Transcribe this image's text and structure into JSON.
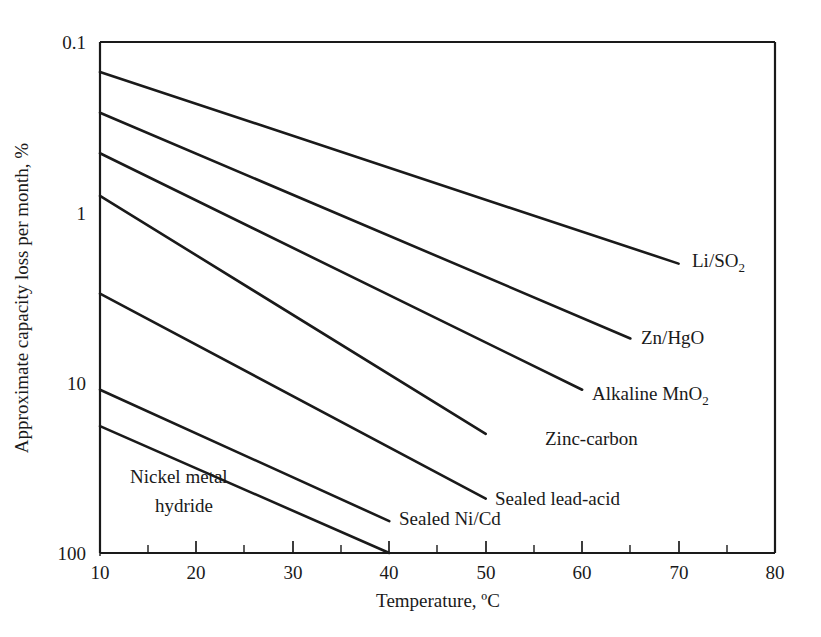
{
  "chart_data": {
    "type": "line",
    "title": "",
    "xlabel": "Temperature, ºC",
    "ylabel": "Approximate capacity loss per month, %",
    "xlim": [
      10,
      80
    ],
    "ylim": [
      0.1,
      100
    ],
    "yscale": "log",
    "y_inverted": true,
    "grid": false,
    "legend_position": "inline-right-of-each-line",
    "x_ticks": [
      10,
      20,
      30,
      40,
      50,
      60,
      70,
      80
    ],
    "x_tick_labels": [
      "10",
      "20",
      "30",
      "40",
      "50",
      "60",
      "70",
      "80"
    ],
    "x_minor_ticks": [
      15,
      25,
      35,
      45,
      55,
      65,
      75
    ],
    "y_ticks": [
      0.1,
      1,
      10,
      100
    ],
    "y_tick_labels": [
      "0.1",
      "1",
      "10",
      "100"
    ],
    "series": [
      {
        "name": "Li/SO2",
        "label": "Li/SO",
        "label_sub": "2",
        "points": [
          [
            10,
            0.15
          ],
          [
            70,
            2.0
          ]
        ]
      },
      {
        "name": "Zn/HgO",
        "label": "Zn/HgO",
        "label_sub": "",
        "points": [
          [
            10,
            0.26
          ],
          [
            65,
            5.5
          ]
        ]
      },
      {
        "name": "Alkaline MnO2",
        "label": "Alkaline MnO",
        "label_sub": "2",
        "points": [
          [
            10,
            0.45
          ],
          [
            60,
            11.0
          ]
        ]
      },
      {
        "name": "Zinc-carbon",
        "label": "Zinc-carbon",
        "label_sub": "",
        "points": [
          [
            10,
            0.8
          ],
          [
            50,
            20.0
          ]
        ]
      },
      {
        "name": "Sealed lead-acid",
        "label": "Sealed lead-acid",
        "label_sub": "",
        "points": [
          [
            10,
            3.0
          ],
          [
            50,
            48.0
          ]
        ]
      },
      {
        "name": "Sealed Ni/Cd",
        "label": "Sealed Ni/Cd",
        "label_sub": "",
        "points": [
          [
            10,
            11.0
          ],
          [
            40,
            65.0
          ]
        ]
      },
      {
        "name": "Nickel metal hydride",
        "label": "Nickel metal",
        "label_line2": "hydride",
        "label_sub": "",
        "points": [
          [
            10,
            18.0
          ],
          [
            40,
            100.0
          ]
        ]
      }
    ]
  },
  "labels": {
    "li_so2": "Li/SO",
    "li_so2_sub": "2",
    "zn_hgo": "Zn/HgO",
    "alkaline_mno2": "Alkaline MnO",
    "alkaline_mno2_sub": "2",
    "zinc_carbon": "Zinc-carbon",
    "sealed_lead_acid": "Sealed lead-acid",
    "sealed_nicd": "Sealed Ni/Cd",
    "nimh_line1": "Nickel metal",
    "nimh_line2": "hydride"
  },
  "axes": {
    "x_title": "Temperature, ºC",
    "y_title": "Approximate capacity loss per month, %",
    "x_tick_10": "10",
    "x_tick_20": "20",
    "x_tick_30": "30",
    "x_tick_40": "40",
    "x_tick_50": "50",
    "x_tick_60": "60",
    "x_tick_70": "70",
    "x_tick_80": "80",
    "y_tick_01": "0.1",
    "y_tick_1": "1",
    "y_tick_10": "10",
    "y_tick_100": "100"
  },
  "colors": {
    "line": "#1a1a1a",
    "axis": "#1a1a1a",
    "text": "#231f20",
    "background": "#ffffff"
  }
}
